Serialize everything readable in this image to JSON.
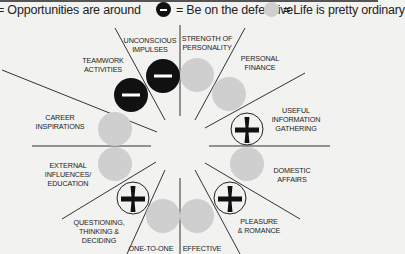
{
  "legend": {
    "opportunity": {
      "label": "= Opportunities are around",
      "symbol": "plus-circle"
    },
    "defensive": {
      "label": "= Be on the defensive",
      "symbol": "minus-circle"
    },
    "ordinary": {
      "label": "= Life is pretty ordinary",
      "symbol": "grey-circle"
    }
  },
  "colors": {
    "background": "#f2f2f0",
    "minus_fill": "#111111",
    "grey_fill": "#cfcfcf",
    "line": "#333333"
  },
  "wheel": {
    "houses": [
      {
        "label_lines": [
          "UNCONSCIOUS",
          "IMPULSES"
        ],
        "status": "defensive"
      },
      {
        "label_lines": [
          "STRENGTH OF",
          "PERSONALITY"
        ],
        "status": "ordinary"
      },
      {
        "label_lines": [
          "PERSONAL",
          "FINANCE"
        ],
        "status": "ordinary"
      },
      {
        "label_lines": [
          "USEFUL",
          "INFORMATION",
          "GATHERING"
        ],
        "status": "opportunity"
      },
      {
        "label_lines": [
          "DOMESTIC",
          "AFFAIRS"
        ],
        "status": "ordinary"
      },
      {
        "label_lines": [
          "PLEASURE",
          "& ROMANCE"
        ],
        "status": "opportunity"
      },
      {
        "label_lines": [
          "EFFECTIVE"
        ],
        "status": "ordinary"
      },
      {
        "label_lines": [
          "ONE-TO-ONE"
        ],
        "status": "ordinary"
      },
      {
        "label_lines": [
          "QUESTIONING,",
          "THINKING &",
          "DECIDING"
        ],
        "status": "opportunity"
      },
      {
        "label_lines": [
          "EXTERNAL",
          "INFLUENCES/",
          "EDUCATION"
        ],
        "status": "ordinary"
      },
      {
        "label_lines": [
          "CAREER",
          "INSPIRATIONS"
        ],
        "status": "ordinary"
      },
      {
        "label_lines": [
          "TEAMWORK",
          "ACTIVITIES"
        ],
        "status": "defensive"
      }
    ]
  }
}
